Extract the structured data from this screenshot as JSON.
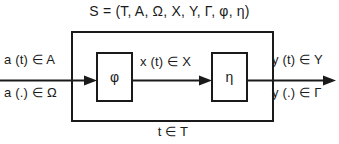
{
  "diagram": {
    "title": "S = (T, A, Ω, X, Y, Γ, φ, η)",
    "time_label": "t ∈ T",
    "input": {
      "signal_label": "a (t) ∈ A",
      "function_label": "a (.) ∈ Ω",
      "arrow_name": "input-arrow"
    },
    "state": {
      "label": "x (t) ∈ X",
      "arrow_name": "state-arrow"
    },
    "output": {
      "signal_label": "y (t) ∈ Y",
      "function_label": "y (.) ∈ Γ",
      "arrow_name": "output-arrow"
    },
    "blocks": [
      {
        "id": "transition",
        "glyph": "φ"
      },
      {
        "id": "output",
        "glyph": "η"
      }
    ],
    "colors": {
      "background": "#ffffff",
      "stroke": "#1a1a1a",
      "text": "#1a1a1a"
    }
  }
}
